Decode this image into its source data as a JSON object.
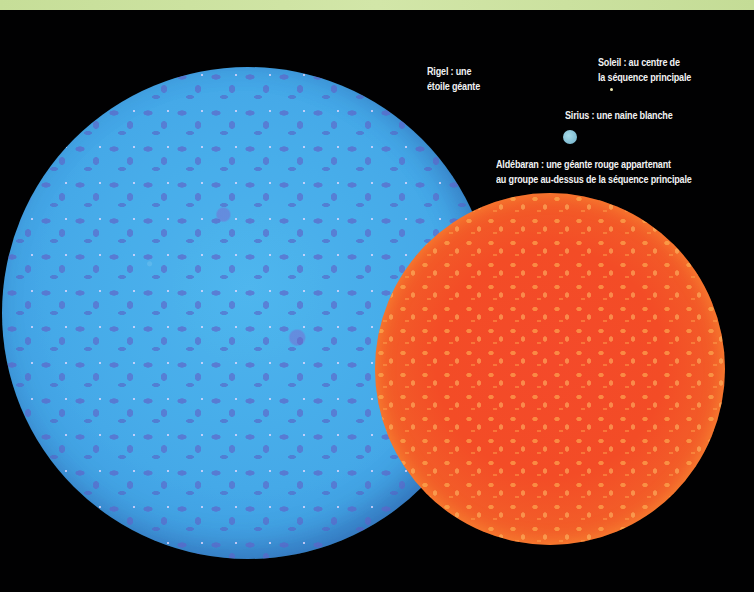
{
  "header_band": {
    "color": "#c8e09a"
  },
  "background_color": "#020203",
  "stars": {
    "rigel": {
      "name": "Rigel",
      "label_lines": [
        "Rigel : une",
        "étoile géante"
      ],
      "color": "#45a9e8",
      "mottle_color": "#6064c8"
    },
    "soleil": {
      "name": "Soleil",
      "label_lines": [
        "Soleil : au centre de",
        "la séquence principale"
      ],
      "color": "#f2e9b0"
    },
    "sirius": {
      "name": "Sirius",
      "label_lines": [
        "Sirius : une naine blanche"
      ],
      "color": "#8cc6da"
    },
    "aldebaran": {
      "name": "Aldébaran",
      "label_lines": [
        "Aldébaran : une géante rouge appartenant",
        "au groupe au-dessus de la séquence principale"
      ],
      "color": "#f34c26",
      "rim_color": "#f08a34"
    }
  }
}
